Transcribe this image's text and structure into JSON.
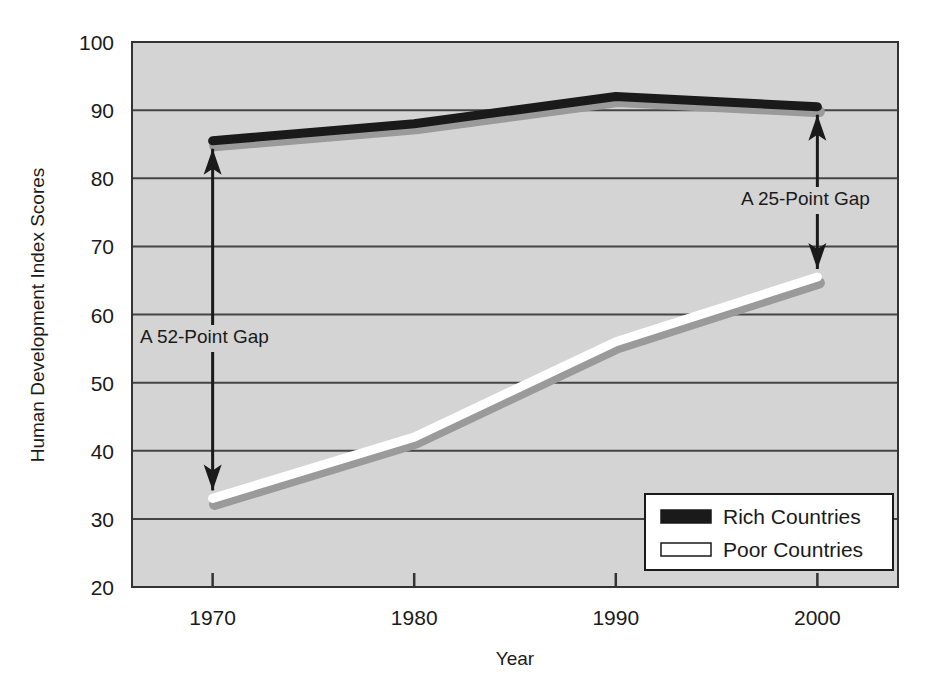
{
  "chart_data": {
    "type": "line",
    "title": "",
    "xlabel": "Year",
    "ylabel": "Human Development Index Scores",
    "x": [
      1970,
      1980,
      1990,
      2000
    ],
    "xtick_labels": [
      "1970",
      "1980",
      "1990",
      "2000"
    ],
    "xlim": [
      1966,
      2004
    ],
    "ylim": [
      20,
      100
    ],
    "ytick_labels": [
      "20",
      "30",
      "40",
      "50",
      "60",
      "70",
      "80",
      "90",
      "100"
    ],
    "ytick_values": [
      20,
      30,
      40,
      50,
      60,
      70,
      80,
      90,
      100
    ],
    "grid": "horizontal",
    "legend_position": "bottom-right",
    "plot_background": "#d4d4d4",
    "series": [
      {
        "name": "Rich Countries",
        "color": "#1a1a1a",
        "swatch": "filled",
        "values": [
          85.5,
          88.0,
          92.0,
          90.5
        ]
      },
      {
        "name": "Poor Countries",
        "color": "#ffffff",
        "swatch": "outlined",
        "values": [
          33.0,
          42.0,
          56.0,
          65.5
        ]
      }
    ],
    "annotations": [
      {
        "id": "gap-1970",
        "text": "A  52-Point Gap",
        "x": 1970,
        "y_top": 85.5,
        "y_bottom": 33.0,
        "gap": 52,
        "style": "double-headed-arrow"
      },
      {
        "id": "gap-2000",
        "text": "A 25-Point Gap",
        "x": 2000,
        "y_top": 90.5,
        "y_bottom": 65.5,
        "gap": 25,
        "style": "double-headed-arrow"
      }
    ]
  },
  "axes": {
    "y_title": "Human Development Index Scores",
    "x_title": "Year",
    "y_ticks": [
      "100",
      "90",
      "80",
      "70",
      "60",
      "50",
      "40",
      "30",
      "20"
    ],
    "x_ticks": [
      "1970",
      "1980",
      "1990",
      "2000"
    ]
  },
  "legend": {
    "entries": [
      {
        "label": "Rich Countries"
      },
      {
        "label": "Poor Countries"
      }
    ]
  },
  "annotations": {
    "left": "A  52-Point Gap",
    "right": "A 25-Point Gap"
  },
  "colors": {
    "plot_bg": "#d4d4d4",
    "axis": "#333333",
    "grid": "#444444",
    "rich_line": "#1a1a1a",
    "poor_line": "#ffffff",
    "shadow": "#9a9a9a",
    "legend_bg": "#ffffff",
    "text": "#1a1a1a"
  }
}
